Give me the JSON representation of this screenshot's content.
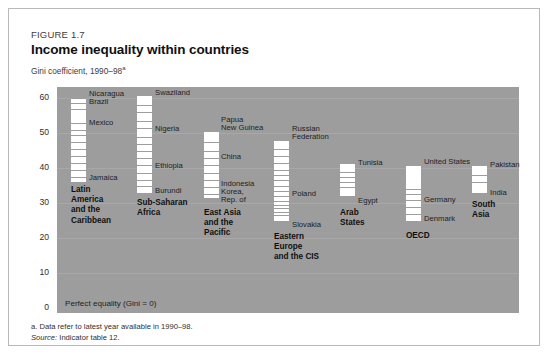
{
  "figure": {
    "number": "FIGURE 1.7",
    "title": "Income inequality within countries",
    "subtitle": "Gini coefficient, 1990–98",
    "subtitle_superscript": "a"
  },
  "footnotes": {
    "note_a": "a. Data refer to latest year available in 1990–98.",
    "source_label": "Source:",
    "source_text": " Indicator table 12."
  },
  "plot": {
    "baseline_label": "Perfect equality (Gini = 0)",
    "background_color": "#9d9d9d",
    "bar_color": "#ffffff"
  },
  "chart_data": {
    "type": "bar",
    "title": "Income inequality within countries",
    "subtitle": "Gini coefficient, 1990–98",
    "xlabel": "",
    "ylabel": "Gini coefficient",
    "ylim": [
      0,
      65
    ],
    "yticks": [
      0,
      10,
      20,
      30,
      40,
      50,
      60
    ],
    "ytick_labels": [
      "0",
      "10",
      "20",
      "30",
      "40",
      "50",
      "60"
    ],
    "grid": true,
    "legend": "none",
    "note": "Each vertical white bar spans the range of Gini coefficients observed across countries in the region; horizontal rules mark individual countries.",
    "categories": [
      "Latin America and the Caribbean",
      "Sub-Saharan Africa",
      "East Asia and the Pacific",
      "Eastern Europe and the CIS",
      "Arab States",
      "OECD",
      "South Asia"
    ],
    "groups": [
      {
        "name": "Latin America and the Caribbean",
        "label_lines": [
          "Latin",
          "America",
          "and the",
          "Caribbean"
        ],
        "range_high": 60.0,
        "range_low": 36.0,
        "country_marks": [
          {
            "country": "Nicaragua",
            "value": 60.0,
            "labeled": true
          },
          {
            "country": "Brazil",
            "value": 58.0,
            "labeled": true
          },
          {
            "country": "Mexico",
            "value": 52.0,
            "labeled": true
          },
          {
            "country": "Jamaica",
            "value": 36.0,
            "labeled": true
          }
        ],
        "tick_values": [
          60.0,
          58.5,
          57.0,
          53.0,
          51.0,
          49.5,
          47.5,
          45.5,
          43.5,
          41.5,
          39.5,
          37.5
        ]
      },
      {
        "name": "Sub-Saharan Africa",
        "label_lines": [
          "Sub-Saharan",
          "Africa"
        ],
        "range_high": 61.0,
        "range_low": 33.0,
        "country_marks": [
          {
            "country": "Swaziland",
            "value": 61.0,
            "labeled": true
          },
          {
            "country": "Nigeria",
            "value": 50.5,
            "labeled": true
          },
          {
            "country": "Ethiopia",
            "value": 40.0,
            "labeled": true
          },
          {
            "country": "Burundi",
            "value": 33.0,
            "labeled": true
          }
        ],
        "tick_values": [
          61.0,
          58.0,
          56.0,
          53.5,
          51.5,
          49.0,
          47.0,
          45.0,
          43.0,
          41.0,
          38.5,
          36.5,
          35.0
        ]
      },
      {
        "name": "East Asia and the Pacific",
        "label_lines": [
          "East Asia",
          "and the",
          "Pacific"
        ],
        "range_high": 50.5,
        "range_low": 31.5,
        "country_marks": [
          {
            "country": "Papua New Guinea",
            "value": 50.5,
            "labeled": true
          },
          {
            "country": "China",
            "value": 40.3,
            "labeled": true
          },
          {
            "country": "Indonesia",
            "value": 36.5,
            "labeled": true
          },
          {
            "country": "Korea, Rep. of",
            "value": 31.5,
            "labeled": true
          }
        ],
        "tick_values": [
          50.5,
          47.5,
          45.0,
          43.0,
          41.0,
          38.5,
          36.5,
          34.5,
          32.5
        ]
      },
      {
        "name": "Eastern Europe and the CIS",
        "label_lines": [
          "Eastern",
          "Europe",
          "and the CIS"
        ],
        "range_high": 48.0,
        "range_low": 25.0,
        "country_marks": [
          {
            "country": "Russian Federation",
            "value": 48.0,
            "labeled": true
          },
          {
            "country": "Poland",
            "value": 33.0,
            "labeled": true
          },
          {
            "country": "Slovakia",
            "value": 25.0,
            "labeled": true
          }
        ],
        "tick_values": [
          48.0,
          45.5,
          43.5,
          41.5,
          39.5,
          38.0,
          36.5,
          35.0,
          33.5,
          32.0,
          30.5,
          29.5,
          28.5,
          27.5,
          26.5
        ]
      },
      {
        "name": "Arab States",
        "label_lines": [
          "Arab",
          "States"
        ],
        "range_high": 41.5,
        "range_low": 32.0,
        "country_marks": [
          {
            "country": "Tunisia",
            "value": 41.5,
            "labeled": true
          },
          {
            "country": "Egypt",
            "value": 32.0,
            "labeled": true
          }
        ],
        "tick_values": [
          41.5,
          39.0,
          37.5,
          36.0,
          34.5
        ]
      },
      {
        "name": "OECD",
        "label_lines": [
          "OECD"
        ],
        "range_high": 41.0,
        "range_low": 25.0,
        "country_marks": [
          {
            "country": "United States",
            "value": 41.0,
            "labeled": true
          },
          {
            "country": "Germany",
            "value": 30.0,
            "labeled": true
          },
          {
            "country": "Denmark",
            "value": 25.0,
            "labeled": true
          }
        ],
        "tick_values": [
          41.0,
          34.0,
          32.5,
          31.0,
          29.0,
          27.0
        ]
      },
      {
        "name": "South Asia",
        "label_lines": [
          "South",
          "Asia"
        ],
        "range_high": 41.0,
        "range_low": 33.0,
        "country_marks": [
          {
            "country": "Pakistan",
            "value": 41.0,
            "labeled": true
          },
          {
            "country": "India",
            "value": 33.0,
            "labeled": true
          }
        ],
        "tick_values": [
          41.0,
          38.0,
          36.0
        ]
      }
    ]
  },
  "layout": {
    "groups": [
      {
        "bar_left": 62,
        "labels": [
          {
            "text": "Nicaragua",
            "x": 80,
            "y": 80
          },
          {
            "text": "Brazil",
            "x": 80,
            "y": 88
          },
          {
            "text": "Mexico",
            "x": 80,
            "y": 109
          },
          {
            "text": "Jamaica",
            "x": 80,
            "y": 164
          }
        ],
        "group_label": {
          "x": 62,
          "y": 176
        }
      },
      {
        "bar_left": 128,
        "labels": [
          {
            "text": "Swaziland",
            "x": 146,
            "y": 79
          },
          {
            "text": "Nigeria",
            "x": 146,
            "y": 115
          },
          {
            "text": "Ethiopia",
            "x": 146,
            "y": 152
          },
          {
            "text": "Burundi",
            "x": 146,
            "y": 177
          }
        ],
        "group_label": {
          "x": 128,
          "y": 189
        }
      },
      {
        "bar_left": 195,
        "labels": [
          {
            "text": "Papua",
            "x": 212,
            "y": 106
          },
          {
            "text": "New Guinea",
            "x": 212,
            "y": 114
          },
          {
            "text": "China",
            "x": 212,
            "y": 143
          },
          {
            "text": "Indonesia",
            "x": 212,
            "y": 170
          },
          {
            "text": "Korea,",
            "x": 212,
            "y": 178
          },
          {
            "text": "Rep. of",
            "x": 212,
            "y": 186
          }
        ],
        "group_label": {
          "x": 195,
          "y": 199
        }
      },
      {
        "bar_left": 265,
        "labels": [
          {
            "text": "Russian",
            "x": 283,
            "y": 115
          },
          {
            "text": "Federation",
            "x": 283,
            "y": 123
          },
          {
            "text": "Poland",
            "x": 283,
            "y": 180
          },
          {
            "text": "Slovakia",
            "x": 283,
            "y": 211
          }
        ],
        "group_label": {
          "x": 265,
          "y": 223
        }
      },
      {
        "bar_left": 331,
        "labels": [
          {
            "text": "Tunisia",
            "x": 349,
            "y": 149
          },
          {
            "text": "Egypt",
            "x": 349,
            "y": 187
          }
        ],
        "group_label": {
          "x": 331,
          "y": 199
        }
      },
      {
        "bar_left": 397,
        "labels": [
          {
            "text": "United States",
            "x": 415,
            "y": 148
          },
          {
            "text": "Germany",
            "x": 415,
            "y": 186
          },
          {
            "text": "Denmark",
            "x": 415,
            "y": 205
          }
        ],
        "group_label": {
          "x": 397,
          "y": 222
        }
      },
      {
        "bar_left": 463,
        "labels": [
          {
            "text": "Pakistan",
            "x": 481,
            "y": 151
          },
          {
            "text": "India",
            "x": 481,
            "y": 179
          }
        ],
        "group_label": {
          "x": 463,
          "y": 191
        }
      }
    ]
  }
}
